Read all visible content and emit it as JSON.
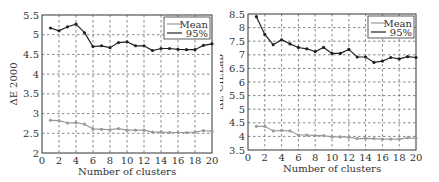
{
  "chart_data": [
    {
      "type": "line",
      "title": "",
      "xlabel": "Number of clusters",
      "ylabel": "ΔE 2000",
      "x": [
        1,
        2,
        3,
        4,
        5,
        6,
        7,
        8,
        9,
        10,
        11,
        12,
        13,
        14,
        15,
        16,
        17,
        18,
        19,
        20
      ],
      "xlim": [
        0,
        20
      ],
      "ylim": [
        2,
        5.5
      ],
      "xticks": [
        0,
        2,
        4,
        6,
        8,
        10,
        12,
        14,
        16,
        18,
        20
      ],
      "yticks": [
        2,
        2.5,
        3,
        3.5,
        4,
        4.5,
        5,
        5.5
      ],
      "ytick_labels": [
        "2",
        "2.5",
        "3",
        "3.5",
        "4",
        "4.5",
        "5",
        "5.5"
      ],
      "grid": true,
      "legend_position": "upper right",
      "series": [
        {
          "name": "Mean",
          "color": "#9a9a9a",
          "values": [
            2.83,
            2.82,
            2.76,
            2.77,
            2.73,
            2.61,
            2.6,
            2.59,
            2.62,
            2.58,
            2.58,
            2.58,
            2.53,
            2.53,
            2.52,
            2.52,
            2.52,
            2.53,
            2.57,
            2.55
          ]
        },
        {
          "name": "95%",
          "color": "#222222",
          "values": [
            5.17,
            5.1,
            5.2,
            5.27,
            5.05,
            4.7,
            4.72,
            4.67,
            4.8,
            4.82,
            4.72,
            4.72,
            4.6,
            4.65,
            4.65,
            4.63,
            4.62,
            4.62,
            4.73,
            4.77
          ]
        }
      ]
    },
    {
      "type": "line",
      "title": "",
      "xlabel": "Number of clusters",
      "ylabel": "ΔE CIELab",
      "x": [
        1,
        2,
        3,
        4,
        5,
        6,
        7,
        8,
        9,
        10,
        11,
        12,
        13,
        14,
        15,
        16,
        17,
        18,
        19,
        20
      ],
      "xlim": [
        0,
        20
      ],
      "ylim": [
        3.5,
        8.5
      ],
      "xticks": [
        0,
        2,
        4,
        6,
        8,
        10,
        12,
        14,
        16,
        18,
        20
      ],
      "yticks": [
        3.5,
        4,
        4.5,
        5,
        5.5,
        6,
        6.5,
        7,
        7.5,
        8,
        8.5
      ],
      "ytick_labels": [
        "3.5",
        "4",
        "4.5",
        "5",
        "5.5",
        "6",
        "6.5",
        "7",
        "7.5",
        "8",
        "8.5"
      ],
      "grid": true,
      "legend_position": "upper right",
      "series": [
        {
          "name": "Mean",
          "color": "#9a9a9a",
          "values": [
            4.37,
            4.37,
            4.2,
            4.22,
            4.2,
            4.05,
            4.05,
            4.03,
            4.03,
            3.98,
            3.98,
            3.97,
            3.92,
            3.93,
            3.92,
            3.9,
            3.9,
            3.9,
            3.95,
            3.93
          ]
        },
        {
          "name": "95%",
          "color": "#222222",
          "values": [
            8.4,
            7.75,
            7.37,
            7.55,
            7.4,
            7.27,
            7.22,
            7.12,
            7.27,
            7.05,
            7.05,
            7.2,
            6.92,
            6.92,
            6.72,
            6.77,
            6.9,
            6.85,
            6.93,
            6.9
          ]
        }
      ]
    }
  ],
  "layout": [
    {
      "plot": {
        "left": 42,
        "top": 15,
        "right": 212,
        "bottom": 153
      }
    },
    {
      "plot": {
        "left": 28,
        "top": 14,
        "right": 196,
        "bottom": 150
      }
    }
  ]
}
